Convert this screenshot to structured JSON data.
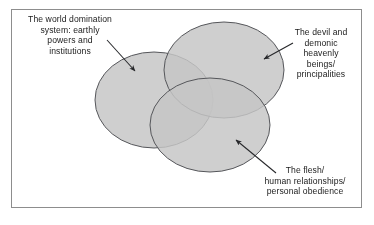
{
  "diagram": {
    "type": "venn",
    "set_count": 3,
    "title": "",
    "border_color": "#8d8d8d",
    "background_color": "#ffffff",
    "text_color": "#1b1b1b",
    "fill_color": "#c0c0c0",
    "stroke_color": "#55565a",
    "overlap_pair_color": "#9c9c9c",
    "overlap_triple_color": "#7f7f80",
    "sets": [
      {
        "id": "world-domination-system",
        "label_lines": [
          "The world domination",
          "system: earthly",
          "powers and",
          "institutions"
        ],
        "label_text": "The world domination system: earthly powers and institutions",
        "position": "left",
        "leader_arrow": {
          "from_x": 107,
          "from_y": 40,
          "to_x": 137,
          "to_y": 73
        }
      },
      {
        "id": "devil-and-demonic-beings",
        "label_lines": [
          "The devil and",
          "demonic",
          "heavenly",
          "beings/",
          "principalities"
        ],
        "label_text": "The devil and demonic heavenly beings/ principalities",
        "position": "top-right",
        "leader_arrow": {
          "from_x": 293,
          "from_y": 43,
          "to_x": 261,
          "to_y": 61
        }
      },
      {
        "id": "the-flesh",
        "label_lines": [
          "The flesh/",
          "human relationships/",
          "personal obedience"
        ],
        "label_text": "The flesh/ human relationships/ personal obedience",
        "position": "bottom-right",
        "leader_arrow": {
          "from_x": 276,
          "from_y": 173,
          "to_x": 233,
          "to_y": 138
        }
      }
    ],
    "ellipses": [
      {
        "id": "ellipse-world",
        "cx": 154,
        "cy": 100,
        "rx": 59,
        "ry": 48
      },
      {
        "id": "ellipse-devil",
        "cx": 224,
        "cy": 70,
        "rx": 60,
        "ry": 48
      },
      {
        "id": "ellipse-flesh",
        "cx": 210,
        "cy": 125,
        "rx": 60,
        "ry": 47
      }
    ]
  }
}
